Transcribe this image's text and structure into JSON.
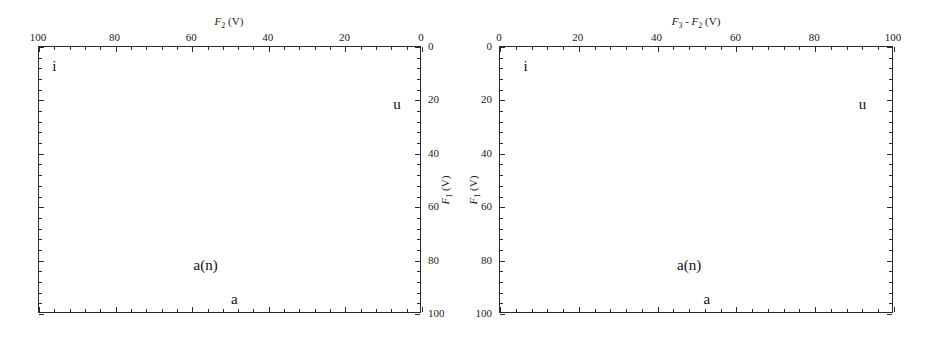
{
  "figure": {
    "panels": [
      {
        "id": "left",
        "x_axis": {
          "position": "top",
          "title_parts": {
            "var": "F",
            "sub": "2",
            "unit": "(V)"
          },
          "title_text": "F2 (V)",
          "tick_labels": [
            "100",
            "80",
            "60",
            "40",
            "20",
            "0"
          ],
          "tick_values": [
            100,
            80,
            60,
            40,
            20,
            0
          ],
          "min": 0,
          "max": 100,
          "reversed": true,
          "minor_ticks_per_interval": 4
        },
        "y_axis": {
          "position": "right",
          "title_parts": {
            "var": "F",
            "sub": "1",
            "unit": "(V)"
          },
          "title_text": "F1 (V)",
          "tick_labels": [
            "0",
            "20",
            "40",
            "60",
            "80",
            "100"
          ],
          "tick_values": [
            0,
            20,
            40,
            60,
            80,
            100
          ],
          "min": 0,
          "max": 100,
          "reversed": false,
          "minor_ticks_per_interval": 4
        },
        "annotations": [
          {
            "text": "i",
            "x_pct": 4.0,
            "y_pct": 7.0
          },
          {
            "text": "u",
            "x_pct": 93.5,
            "y_pct": 21.5
          },
          {
            "text": "a(n)",
            "x_pct": 43.5,
            "y_pct": 81.5
          },
          {
            "text": "a",
            "x_pct": 51.0,
            "y_pct": 94.5
          }
        ]
      },
      {
        "id": "right",
        "x_axis": {
          "position": "top",
          "title_parts": {
            "var": "F",
            "sub": "3",
            "unit": "",
            "var2": "F",
            "sub2": "2",
            "unit2": "(V)",
            "operator": "-"
          },
          "title_text": "F3 - F2 (V)",
          "tick_labels": [
            "0",
            "20",
            "40",
            "60",
            "80",
            "100"
          ],
          "tick_values": [
            0,
            20,
            40,
            60,
            80,
            100
          ],
          "min": 0,
          "max": 100,
          "reversed": false,
          "minor_ticks_per_interval": 4
        },
        "y_axis": {
          "position": "left",
          "title_parts": {
            "var": "F",
            "sub": "1",
            "unit": "(V)"
          },
          "title_text": "F1 (V)",
          "tick_labels": [
            "0",
            "20",
            "40",
            "60",
            "80",
            "100"
          ],
          "tick_values": [
            0,
            20,
            40,
            60,
            80,
            100
          ],
          "min": 0,
          "max": 100,
          "reversed": false,
          "minor_ticks_per_interval": 4
        },
        "annotations": [
          {
            "text": "i",
            "x_pct": 6.5,
            "y_pct": 7.0
          },
          {
            "text": "u",
            "x_pct": 92.0,
            "y_pct": 21.5
          },
          {
            "text": "a(n)",
            "x_pct": 48.0,
            "y_pct": 81.5
          },
          {
            "text": "a",
            "x_pct": 52.5,
            "y_pct": 94.5
          }
        ]
      }
    ],
    "style": {
      "frame_color": "#2b2b2b",
      "text_color": "#1a1a1a",
      "background": "#ffffff"
    }
  }
}
